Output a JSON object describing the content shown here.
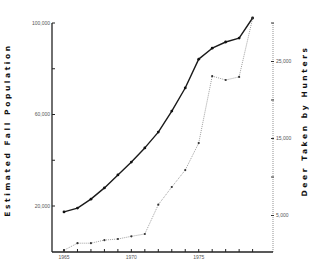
{
  "chart_data": {
    "type": "line",
    "title": "",
    "xlabel": "",
    "x": [
      1965,
      1966,
      1967,
      1968,
      1969,
      1970,
      1971,
      1972,
      1973,
      1974,
      1975,
      1976,
      1977,
      1978,
      1979
    ],
    "xlim": [
      1965,
      1979
    ],
    "x_tick_labels": [
      {
        "value": 1965,
        "label": "1965"
      },
      {
        "value": 1970,
        "label": "1970"
      },
      {
        "value": 1975,
        "label": "1975"
      }
    ],
    "series": [
      {
        "name": "Estimated Fall Population",
        "axis": "left",
        "style": "solid",
        "values": [
          17400,
          19100,
          23000,
          27900,
          33600,
          39200,
          45400,
          52300,
          61500,
          71600,
          84200,
          89000,
          91700,
          93400,
          102200
        ]
      },
      {
        "name": "Deer Taken by Hunters",
        "axis": "right",
        "style": "dotted",
        "values": [
          500,
          1400,
          1400,
          1800,
          1950,
          2300,
          2600,
          6400,
          8700,
          10900,
          14400,
          23100,
          22600,
          23000,
          30600
        ]
      }
    ],
    "left_axis": {
      "label": "Estimated Fall Population",
      "ylim": [
        0,
        100000
      ],
      "ticks": [
        20000,
        40000,
        60000,
        80000,
        100000
      ],
      "tick_labels": [
        {
          "value": 20000,
          "label": "20,000"
        },
        {
          "value": 60000,
          "label": "60,000"
        },
        {
          "value": 100000,
          "label": "100,000"
        }
      ]
    },
    "right_axis": {
      "label": "Deer Taken by Hunters",
      "ylim": [
        0,
        30000
      ],
      "ticks": [
        5000,
        10000,
        15000,
        20000,
        25000,
        30000
      ],
      "tick_labels": [
        {
          "value": 5000,
          "label": "5,000"
        },
        {
          "value": 15000,
          "label": "15,000"
        },
        {
          "value": 25000,
          "label": "25,000"
        }
      ]
    },
    "grid": false,
    "legend": "none"
  }
}
